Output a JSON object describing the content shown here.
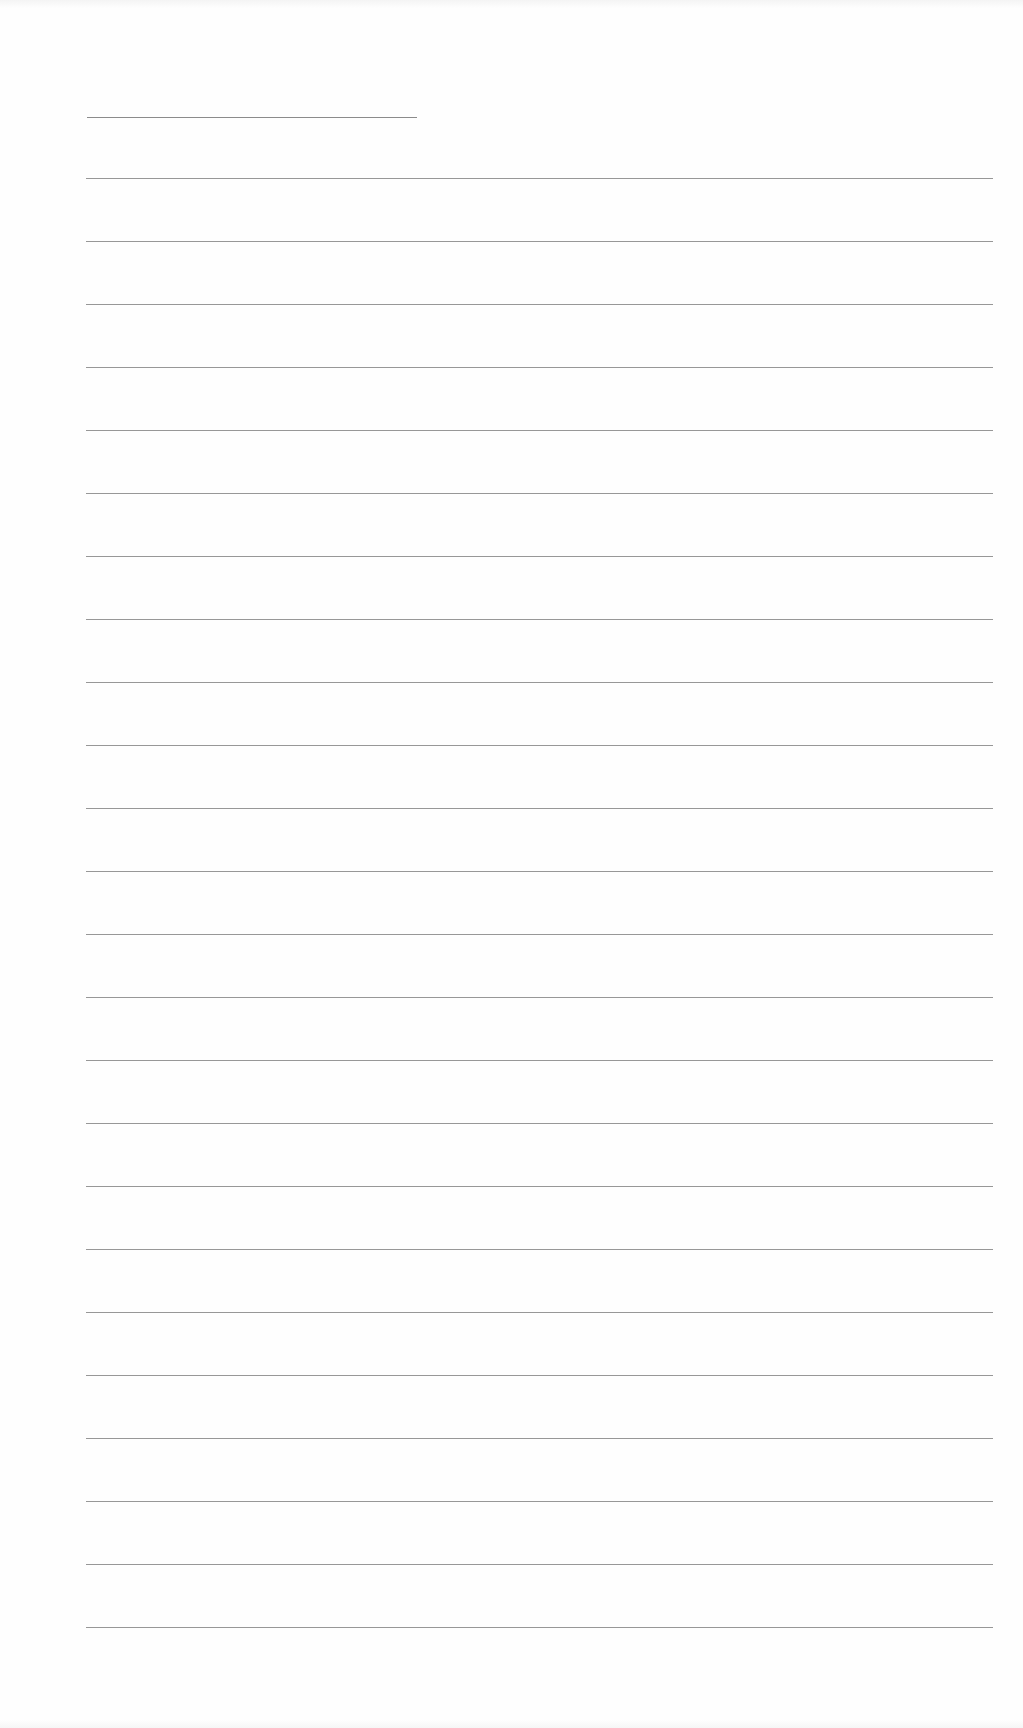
{
  "document": {
    "type": "lined-paper",
    "background_color": "#fefefe",
    "line_color": "#8c8c8c",
    "name_line": {
      "left": 87,
      "right": 417,
      "top": 117
    },
    "ruled_lines": {
      "left": 86,
      "right": 993,
      "first_top": 178,
      "spacing": 63,
      "count": 24
    }
  }
}
